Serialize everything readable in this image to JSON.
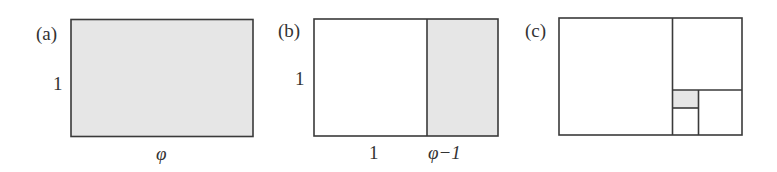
{
  "panels": [
    {
      "id": "a",
      "label": "(a)",
      "side_label": "1",
      "bottom_labels": [
        "φ"
      ]
    },
    {
      "id": "b",
      "label": "(b)",
      "side_label": "1",
      "bottom_labels": [
        "1",
        "φ−1"
      ]
    },
    {
      "id": "c",
      "label": "(c)"
    }
  ],
  "colors": {
    "stroke": "#3a3a3a",
    "shade": "#e6e6e6",
    "background": "#ffffff"
  }
}
